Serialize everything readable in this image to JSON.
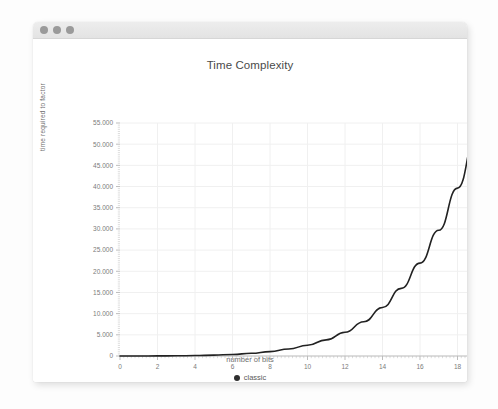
{
  "window": {
    "dots": [
      "close-dot",
      "minimize-dot",
      "maximize-dot"
    ]
  },
  "chart_data": {
    "type": "line",
    "title": "Time Complexity",
    "xlabel": "number of bits",
    "ylabel": "time required to factor",
    "xlim": [
      0,
      20
    ],
    "ylim": [
      0,
      55000
    ],
    "xticks": [
      "0",
      "2",
      "4",
      "6",
      "8",
      "10",
      "12",
      "14",
      "16",
      "18",
      "20"
    ],
    "xtick_values": [
      0,
      2,
      4,
      6,
      8,
      10,
      12,
      14,
      16,
      18,
      20
    ],
    "yticks": [
      "0",
      "5.000",
      "10.000",
      "15.000",
      "20.000",
      "25.000",
      "30.000",
      "35.000",
      "40.000",
      "45.000",
      "50.000",
      "55.000"
    ],
    "ytick_values": [
      0,
      5000,
      10000,
      15000,
      20000,
      25000,
      30000,
      35000,
      40000,
      45000,
      50000,
      55000
    ],
    "grid": true,
    "minor_ticks": true,
    "legend_position": "bottom",
    "series": [
      {
        "name": "classic",
        "color": "#222222",
        "x": [
          0,
          1,
          2,
          3,
          4,
          5,
          6,
          7,
          8,
          9,
          10,
          11,
          12,
          13,
          14,
          15,
          16,
          17,
          18,
          19,
          20
        ],
        "values": [
          0,
          5,
          18,
          48,
          105,
          205,
          370,
          635,
          1040,
          1650,
          2540,
          3810,
          5600,
          8080,
          11450,
          15970,
          21930,
          29680,
          39620,
          52180,
          51000
        ]
      }
    ],
    "annotations": []
  },
  "legend": {
    "entries": [
      {
        "label": "classic",
        "color": "#2f2f2f"
      }
    ]
  }
}
